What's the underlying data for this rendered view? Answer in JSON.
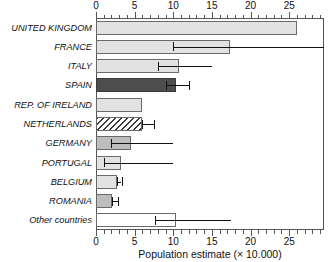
{
  "chart_data": {
    "type": "bar",
    "orientation": "horizontal",
    "title": "",
    "xlabel": "Population estimate (× 10.000)",
    "ylabel": "",
    "xlim": [
      0,
      29.5
    ],
    "ylim": [
      0,
      11
    ],
    "grid": false,
    "legend": null,
    "x_ticks_major": [
      0,
      5,
      10,
      15,
      20,
      25
    ],
    "x_tick_labels": [
      "0",
      "5",
      "10",
      "15",
      "20",
      "25"
    ],
    "x_ticks_minor": [
      1,
      2,
      3,
      4,
      6,
      7,
      8,
      9,
      11,
      12,
      13,
      14,
      16,
      17,
      18,
      19,
      21,
      22,
      23,
      24,
      26,
      27,
      28,
      29
    ],
    "axis_top": true,
    "axis_bottom": true,
    "categories": [
      "UNITED KINGDOM",
      "FRANCE",
      "ITALY",
      "SPAIN",
      "REP. OF IRELAND",
      "NETHERLANDS",
      "GERMANY",
      "PORTUGAL",
      "BELGIUM",
      "ROMANIA",
      "Other countries"
    ],
    "values": [
      26.0,
      17.4,
      10.8,
      10.3,
      6.0,
      5.9,
      4.5,
      3.2,
      2.7,
      2.1,
      10.4
    ],
    "error_low": [
      null,
      10.0,
      8.0,
      9.0,
      null,
      5.9,
      2.0,
      1.0,
      2.7,
      2.1,
      7.6
    ],
    "error_high": [
      null,
      29.5,
      15.0,
      12.0,
      null,
      7.5,
      10.0,
      10.0,
      3.3,
      2.9,
      17.5
    ],
    "bar_styles": [
      "light",
      "light",
      "light",
      "dark",
      "light",
      "hatch",
      "medium",
      "light",
      "light",
      "medium",
      "white"
    ],
    "colors": {
      "light": "#e2e2e2",
      "medium": "#bdbdbd",
      "dark": "#4d4d4d",
      "white": "#ffffff",
      "hatch_stroke": "#3c3c3c",
      "bar_outline": "#6a6a6a",
      "axis": "#555555",
      "text": "#111111"
    }
  }
}
